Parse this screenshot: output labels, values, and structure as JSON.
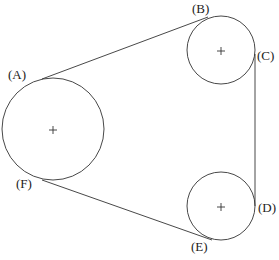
{
  "diagram": {
    "title": "",
    "labels": {
      "A": "(A)",
      "B": "(B)",
      "C": "(C)",
      "D": "(D)",
      "E": "(E)",
      "F": "(F)"
    },
    "colors": {
      "stroke": "#333333",
      "background": "#ffffff"
    },
    "pulleys": [
      {
        "name": "large-pulley",
        "cx": 53,
        "cy": 129,
        "r": 51
      },
      {
        "name": "upper-small-pulley",
        "cx": 221,
        "cy": 50,
        "r": 34
      },
      {
        "name": "lower-small-pulley",
        "cx": 221,
        "cy": 206,
        "r": 34
      }
    ]
  }
}
